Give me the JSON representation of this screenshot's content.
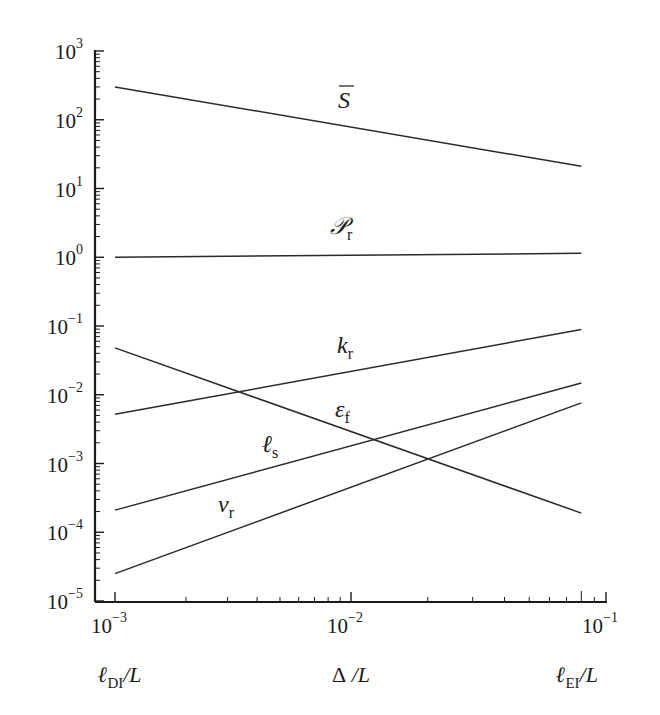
{
  "chart_data": {
    "type": "line",
    "title": "",
    "xscale": "log",
    "yscale": "log",
    "xlim": [
      0.001,
      0.1
    ],
    "ylim": [
      1e-05,
      1000
    ],
    "grid": false,
    "legend": "inline labels",
    "x_tick_labels": [
      "10^-3",
      "10^-2",
      "10^-1"
    ],
    "y_tick_labels": [
      "10^3",
      "10^2",
      "10^1",
      "10^0",
      "10^-1",
      "10^-2",
      "10^-3",
      "10^-4",
      "10^-5"
    ],
    "x_axis_annotations": [
      {
        "text": "ℓ_DI/L",
        "main": "ℓ",
        "sub": "DI",
        "tail": "/L",
        "at": 0.001
      },
      {
        "text": "Δ/L",
        "main": "Δ",
        "sub": "",
        "tail": " /L",
        "at": 0.01
      },
      {
        "text": "ℓ_EI/L",
        "main": "ℓ",
        "sub": "EI",
        "tail": "/L",
        "at": 0.08
      }
    ],
    "x": [
      0.001,
      0.08
    ],
    "series": [
      {
        "name": "S̄",
        "label_main": "S",
        "label_sub": "",
        "overbar": true,
        "values": [
          300,
          21
        ],
        "label_pos": [
          338,
          108
        ]
      },
      {
        "name": "P_r",
        "label_main": "𝒫",
        "label_sub": "r",
        "overbar": false,
        "values": [
          1.0,
          1.14
        ],
        "label_pos": [
          330,
          234
        ]
      },
      {
        "name": "k_r",
        "label_main": "k",
        "label_sub": "r",
        "overbar": false,
        "values": [
          0.0052,
          0.089
        ],
        "label_pos": [
          337,
          353
        ]
      },
      {
        "name": "ε_f",
        "label_main": "ε",
        "label_sub": "f",
        "overbar": false,
        "values": [
          0.048,
          0.00019
        ],
        "label_pos": [
          335,
          417
        ]
      },
      {
        "name": "ℓ_s",
        "label_main": "ℓ",
        "label_sub": "s",
        "overbar": false,
        "values": [
          0.00021,
          0.0148
        ],
        "label_pos": [
          262,
          452
        ]
      },
      {
        "name": "v_r",
        "label_main": "ν",
        "label_sub": "r",
        "overbar": false,
        "values": [
          2.5e-05,
          0.0076
        ],
        "label_pos": [
          218,
          512
        ]
      }
    ],
    "colors": {
      "line": "#2a2a2a",
      "axis": "#1a1a1a",
      "background": "#ffffff"
    }
  }
}
